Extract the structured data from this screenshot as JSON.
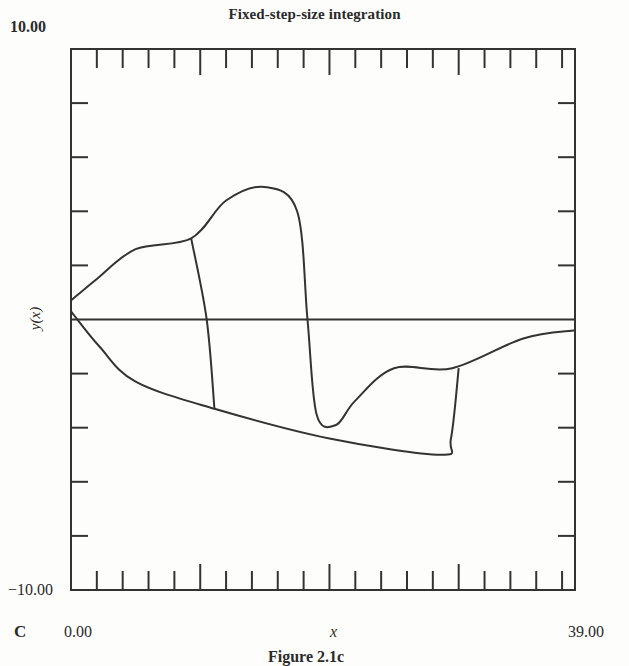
{
  "chart_data": {
    "type": "line",
    "title": "Fixed-step-size integration",
    "xlabel": "x",
    "ylabel": "y(x)",
    "xlim": [
      0.0,
      39.0
    ],
    "ylim": [
      -10.0,
      10.0
    ],
    "x_tick_labels": [
      "0.00",
      "39.00"
    ],
    "y_tick_labels": [
      "10.00",
      "-10.00"
    ],
    "x_minor_tick_step": 2,
    "x_major_ticks": [
      10,
      20,
      30
    ],
    "y_tick_step": 2,
    "grid": false,
    "legend": null,
    "panel_label": "C",
    "caption": "Figure 2.1c",
    "series": [
      {
        "name": "upper solution branch",
        "points": [
          [
            0.0,
            0.7
          ],
          [
            2.0,
            1.5
          ],
          [
            5.0,
            2.6
          ],
          [
            9.3,
            3.0
          ],
          [
            12.0,
            4.4
          ],
          [
            15.0,
            4.9
          ],
          [
            17.5,
            4.0
          ],
          [
            18.3,
            0.0
          ],
          [
            19.0,
            -3.5
          ],
          [
            20.5,
            -3.9
          ],
          [
            22.0,
            -3.0
          ],
          [
            25.0,
            -1.8
          ],
          [
            29.5,
            -1.8
          ],
          [
            35.0,
            -0.7
          ],
          [
            39.0,
            -0.4
          ]
        ]
      },
      {
        "name": "lower solution branch",
        "points": [
          [
            0.0,
            0.3
          ],
          [
            2.2,
            -1.0
          ],
          [
            5.0,
            -2.3
          ],
          [
            11.1,
            -3.3
          ],
          [
            20.0,
            -4.4
          ],
          [
            28.6,
            -5.0
          ],
          [
            29.4,
            -4.4
          ],
          [
            30.0,
            -1.8
          ]
        ]
      },
      {
        "name": "transition 1",
        "points": [
          [
            9.3,
            3.0
          ],
          [
            10.5,
            0.0
          ],
          [
            11.1,
            -3.3
          ]
        ]
      },
      {
        "name": "zero line",
        "points": [
          [
            0.0,
            0.0
          ],
          [
            39.0,
            0.0
          ]
        ]
      }
    ]
  },
  "labels": {
    "title": "Fixed-step-size integration",
    "y_max": "10.00",
    "y_min": "−10.00",
    "y_axis": "y(x)",
    "panel": "C",
    "x_min": "0.00",
    "x_axis": "x",
    "x_max": "39.00",
    "caption": "Figure 2.1c"
  }
}
